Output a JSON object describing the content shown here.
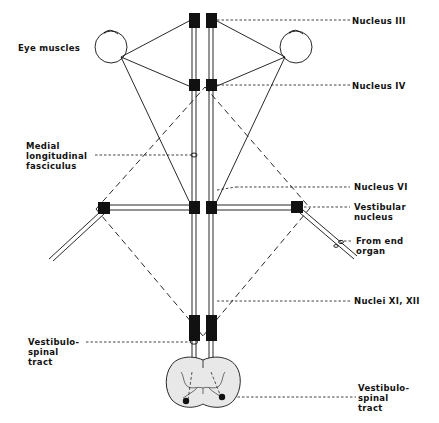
{
  "diagram": {
    "colors": {
      "ink": "#111111",
      "background": "#ffffff",
      "cord_fill": "#e6e6e6"
    },
    "labels": {
      "eye_muscles": "Eye muscles",
      "nucleus_iii": "Nucleus III",
      "nucleus_iv": "Nucleus IV",
      "nucleus_vi": "Nucleus VI",
      "mlf_line1": "Medial",
      "mlf_line2": "longitudinal",
      "mlf_line3": "fasciculus",
      "vestibular_nucleus_line1": "Vestibular",
      "vestibular_nucleus_line2": "nucleus",
      "end_organ_line1": "From end",
      "end_organ_line2": "organ",
      "nuclei_xi_xii": "Nuclei XI, XII",
      "vs_tract_left_line1": "Vestibulo-",
      "vs_tract_left_line2": "spinal",
      "vs_tract_left_line3": "tract",
      "vs_tract_right_line1": "Vestibulo-",
      "vs_tract_right_line2": "spinal",
      "vs_tract_right_line3": "tract"
    },
    "nodes": [
      {
        "id": "nucleus-iii-left",
        "x": 189,
        "y": 13,
        "w": 11,
        "h": 15
      },
      {
        "id": "nucleus-iii-right",
        "x": 206,
        "y": 13,
        "w": 11,
        "h": 15
      },
      {
        "id": "nucleus-iv-left",
        "x": 189,
        "y": 79,
        "w": 11,
        "h": 12
      },
      {
        "id": "nucleus-iv-right",
        "x": 206,
        "y": 79,
        "w": 11,
        "h": 12
      },
      {
        "id": "nucleus-vi-left",
        "x": 189,
        "y": 201,
        "w": 11,
        "h": 13
      },
      {
        "id": "nucleus-vi-right",
        "x": 206,
        "y": 201,
        "w": 11,
        "h": 13
      },
      {
        "id": "vestibular-nucleus-left",
        "x": 98,
        "y": 202,
        "w": 12,
        "h": 12
      },
      {
        "id": "vestibular-nucleus-right",
        "x": 291,
        "y": 201,
        "w": 12,
        "h": 12
      },
      {
        "id": "nuclei-xi-xii-left",
        "x": 189,
        "y": 315,
        "w": 11,
        "h": 26
      },
      {
        "id": "nuclei-xi-xii-right",
        "x": 206,
        "y": 315,
        "w": 11,
        "h": 26
      }
    ]
  }
}
